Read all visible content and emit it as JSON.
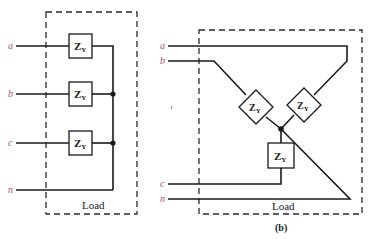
{
  "colors": {
    "terminal_label": "#a8556f",
    "wire": "#1a1a1a"
  },
  "diagram_a": {
    "terminals": [
      {
        "label": "a"
      },
      {
        "label": "b"
      },
      {
        "label": "c"
      },
      {
        "label": "n"
      }
    ],
    "impedances": [
      {
        "label": "Z",
        "subscript": "Y"
      },
      {
        "label": "Z",
        "subscript": "Y"
      },
      {
        "label": "Z",
        "subscript": "Y"
      }
    ],
    "load_label": "Load"
  },
  "diagram_b": {
    "terminals": [
      {
        "label": "a"
      },
      {
        "label": "b"
      },
      {
        "label": "c"
      },
      {
        "label": "n"
      }
    ],
    "impedances": [
      {
        "label": "Z",
        "subscript": "Y"
      },
      {
        "label": "Z",
        "subscript": "Y"
      },
      {
        "label": "Z",
        "subscript": "Y"
      }
    ],
    "load_label": "Load",
    "caption": "(b)"
  }
}
